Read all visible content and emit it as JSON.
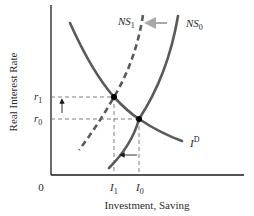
{
  "diagram": {
    "ylabel": "Real Interest Rate",
    "xlabel": "Investment, Saving",
    "origin_label": "0",
    "y_ticks": [
      {
        "main": "r",
        "sub": "1"
      },
      {
        "main": "r",
        "sub": "0"
      }
    ],
    "x_ticks": [
      {
        "main": "I",
        "sub": "1"
      },
      {
        "main": "I",
        "sub": "0"
      }
    ],
    "curves": {
      "investment_demand": {
        "main": "I",
        "sup": "D",
        "style": "solid"
      },
      "saving_initial": {
        "main": "NS",
        "sub": "0",
        "style": "solid"
      },
      "saving_shifted": {
        "main": "NS",
        "sub": "1",
        "style": "dashed"
      }
    },
    "annotations": {
      "shift_arrow": "NS0 shifts left to NS1",
      "rate_arrow": "real interest rate rises from r0 to r1",
      "investment_arrow": "investment falls from I0 to I1"
    },
    "colors": {
      "axis": "#1a1a1a",
      "curve": "#5a5a5a",
      "guide": "#707070",
      "shift_arrow": "#a8a8a8",
      "point": "#000000"
    }
  }
}
